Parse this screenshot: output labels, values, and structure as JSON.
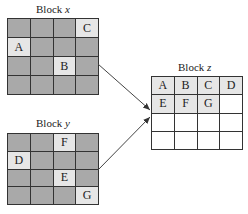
{
  "blocks": {
    "x": {
      "title_prefix": "Block ",
      "title_var": "x",
      "rows": 4,
      "cols": 4,
      "cells": [
        [
          "",
          "",
          "",
          "C"
        ],
        [
          "A",
          "",
          "",
          ""
        ],
        [
          "",
          "",
          "B",
          ""
        ],
        [
          "",
          "",
          "",
          ""
        ]
      ]
    },
    "y": {
      "title_prefix": "Block ",
      "title_var": "y",
      "rows": 4,
      "cols": 4,
      "cells": [
        [
          "",
          "",
          "F",
          ""
        ],
        [
          "D",
          "",
          "",
          ""
        ],
        [
          "",
          "",
          "E",
          ""
        ],
        [
          "",
          "",
          "",
          "G"
        ]
      ]
    },
    "z": {
      "title_prefix": "Block ",
      "title_var": "z",
      "rows": 4,
      "cols": 4,
      "cells": [
        [
          "A",
          "B",
          "C",
          "D"
        ],
        [
          "E",
          "F",
          "G",
          ""
        ],
        [
          "",
          "",
          "",
          ""
        ],
        [
          "",
          "",
          "",
          ""
        ]
      ]
    }
  },
  "arrows": [
    {
      "from": "x",
      "to": "z"
    },
    {
      "from": "y",
      "to": "z"
    }
  ],
  "colors": {
    "empty_source_cell": "#a9a9a9",
    "filled_cell": "#e6e6e6",
    "empty_target_cell": "#ffffff",
    "grid_line": "#333333"
  }
}
